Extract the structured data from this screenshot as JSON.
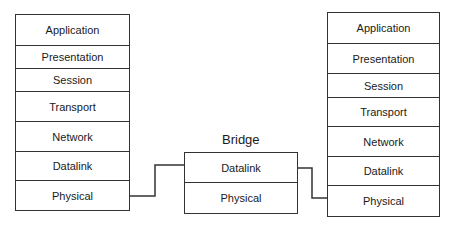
{
  "left_stack": {
    "name": "End host A",
    "layers": [
      {
        "label": "Application"
      },
      {
        "label": "Presentation"
      },
      {
        "label": "Session"
      },
      {
        "label": "Transport"
      },
      {
        "label": "Network"
      },
      {
        "label": "Datalink"
      },
      {
        "label": "Physical"
      }
    ]
  },
  "bridge": {
    "title": "Bridge",
    "layers": [
      {
        "label": "Datalink"
      },
      {
        "label": "Physical"
      }
    ]
  },
  "right_stack": {
    "name": "End host B",
    "layers": [
      {
        "label": "Application"
      },
      {
        "label": "Presentation"
      },
      {
        "label": "Session"
      },
      {
        "label": "Transport"
      },
      {
        "label": "Network"
      },
      {
        "label": "Datalink"
      },
      {
        "label": "Physical"
      }
    ]
  },
  "connections": [
    {
      "from": "left_stack.Physical",
      "to": "bridge.Datalink"
    },
    {
      "from": "bridge.Datalink",
      "to": "right_stack.Physical"
    }
  ]
}
